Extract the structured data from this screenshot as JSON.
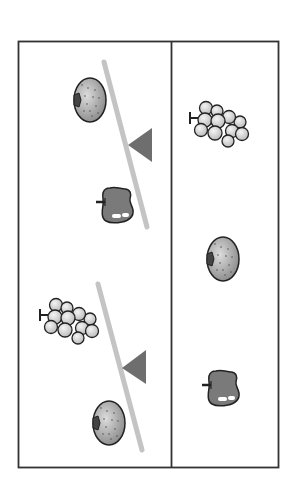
{
  "puzzle": {
    "type": "balance-scale-fruit-puzzle",
    "colors": {
      "frame": "#333333",
      "beam": "#c4c4c4",
      "fulcrum": "#6e6e6e",
      "fruit_outline": "#222222",
      "apple_fill": "#7a7a7a",
      "melon_fill": "#a8a8a8",
      "grape_fill": "#d8d8d8"
    },
    "left_panel": {
      "scales": [
        {
          "id": "scale-1",
          "heavier_side": "melon",
          "lighter_side": "apple",
          "items": [
            "melon",
            "apple"
          ]
        },
        {
          "id": "scale-2",
          "heavier_side": "grapes",
          "lighter_side": "melon",
          "items": [
            "grapes",
            "melon"
          ]
        }
      ]
    },
    "right_panel": {
      "items": [
        "grapes",
        "melon",
        "apple"
      ]
    }
  }
}
